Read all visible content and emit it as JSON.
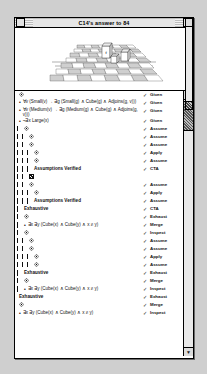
{
  "window": {
    "title": "C14's answer to 84",
    "close_button": "close-box",
    "zoom_button": "zoom-box"
  },
  "world": {
    "name": "blocks-world-checkerboard",
    "grid_columns": 8,
    "grid_rows": 8,
    "objects": [
      {
        "label": "f",
        "type": "cube",
        "col": 4,
        "row": 3
      },
      {
        "label": "",
        "type": "cube",
        "col": 5,
        "row": 4
      },
      {
        "label": "",
        "type": "cube",
        "col": 6,
        "row": 4
      }
    ]
  },
  "scroll": {
    "up_arrow": "▲",
    "down_arrow": "▼",
    "left_arrow": "◀",
    "right_arrow": "▶"
  },
  "proof": {
    "rows": [
      {
        "kind": "icon",
        "icon": "sentence-icon",
        "indent": 0,
        "formula": "",
        "check": "✓",
        "just": "Given"
      },
      {
        "kind": "sentence",
        "icon": "bullet",
        "indent": 0,
        "formula": "∀v (Small(v) → ∃g (Small(g) ∧ Cube(g) ∧ Adjoins(g, v)))",
        "check": "✓",
        "just": "Given"
      },
      {
        "kind": "sentence",
        "icon": "bullet",
        "indent": 0,
        "formula": "∀v (Medium(v) → ∃g (Medium(g) ∧ Cube(g) ∧ Adjoins(g, v)))",
        "check": "✓",
        "just": "Given"
      },
      {
        "kind": "sentence",
        "icon": "bullet",
        "indent": 0,
        "formula": "¬∃x Large(x)",
        "check": "✓",
        "just": "Given"
      },
      {
        "kind": "icon",
        "icon": "diamond-icon",
        "indent": 1,
        "formula": "",
        "check": "✓",
        "just": "Assume"
      },
      {
        "kind": "icon",
        "icon": "diamond-icon",
        "indent": 2,
        "formula": "",
        "check": "✓",
        "just": "Assume"
      },
      {
        "kind": "icon",
        "icon": "diamond-icon",
        "indent": 2,
        "formula": "",
        "check": "✓",
        "just": "Assume"
      },
      {
        "kind": "icon",
        "icon": "diamond-icon",
        "indent": 3,
        "formula": "",
        "check": "✓",
        "just": "Apply"
      },
      {
        "kind": "icon",
        "icon": "diamond-icon",
        "indent": 3,
        "formula": "",
        "check": "✓",
        "just": "Assume"
      },
      {
        "kind": "label",
        "icon": "",
        "indent": 3,
        "formula": "Assumptions Verified",
        "check": "✓",
        "just": "CTA"
      },
      {
        "kind": "selected",
        "icon": "selected-icon",
        "indent": 2,
        "formula": "",
        "check": "",
        "just": ""
      },
      {
        "kind": "icon",
        "icon": "diamond-icon",
        "indent": 2,
        "formula": "",
        "check": "✓",
        "just": "Assume"
      },
      {
        "kind": "icon",
        "icon": "diamond-icon",
        "indent": 3,
        "formula": "",
        "check": "✓",
        "just": "Apply"
      },
      {
        "kind": "label",
        "icon": "",
        "indent": 3,
        "formula": "Assumptions Verified",
        "check": "✓",
        "just": "Assume"
      },
      {
        "kind": "label2",
        "icon": "",
        "indent": 1,
        "formula": "Exhaustive",
        "check": "✓",
        "just": "CTA"
      },
      {
        "kind": "icon",
        "icon": "diamond-icon",
        "indent": 1,
        "formula": "",
        "check": "✓",
        "just": "Exhaust"
      },
      {
        "kind": "sentence",
        "icon": "bullet",
        "indent": 1,
        "formula": "∃x ∃y (Cube(x) ∧ Cube(y) ∧ x ≠ y)",
        "check": "✓",
        "just": "Merge"
      },
      {
        "kind": "icon",
        "icon": "diamond-icon",
        "indent": 1,
        "formula": "",
        "check": "✓",
        "just": "Inspect"
      },
      {
        "kind": "icon",
        "icon": "diamond-icon",
        "indent": 2,
        "formula": "",
        "check": "✓",
        "just": "Assume"
      },
      {
        "kind": "icon",
        "icon": "diamond-icon",
        "indent": 2,
        "formula": "",
        "check": "✓",
        "just": "Assume"
      },
      {
        "kind": "icon",
        "icon": "diamond-icon",
        "indent": 3,
        "formula": "",
        "check": "✓",
        "just": "Apply"
      },
      {
        "kind": "icon",
        "icon": "diamond-icon",
        "indent": 3,
        "formula": "",
        "check": "✓",
        "just": "Assume"
      },
      {
        "kind": "label2",
        "icon": "",
        "indent": 1,
        "formula": "Exhaustive",
        "check": "✓",
        "just": "Exhaust"
      },
      {
        "kind": "icon",
        "icon": "diamond-icon",
        "indent": 1,
        "formula": "",
        "check": "✓",
        "just": "Merge"
      },
      {
        "kind": "sentence",
        "icon": "bullet",
        "indent": 1,
        "formula": "∃x ∃y (Cube(x) ∧ Cube(y) ∧ x ≠ y)",
        "check": "✓",
        "just": "Inspect"
      },
      {
        "kind": "label2",
        "icon": "",
        "indent": 0,
        "formula": "Exhaustive",
        "check": "✓",
        "just": "Exhaust"
      },
      {
        "kind": "icon",
        "icon": "diamond-icon",
        "indent": 0,
        "formula": "",
        "check": "✓",
        "just": "Merge"
      },
      {
        "kind": "sentence",
        "icon": "bullet",
        "indent": 0,
        "formula": "∃x ∃y (Cube(x) ∧ Cube(y) ∧ x ≠ y)",
        "check": "✓",
        "just": "Inspect"
      }
    ]
  },
  "colors": {
    "window_bg": "#ffffff",
    "desktop_bg": "#cfcfcf",
    "title_bg": "#e6e6e6",
    "ink": "#111111"
  }
}
